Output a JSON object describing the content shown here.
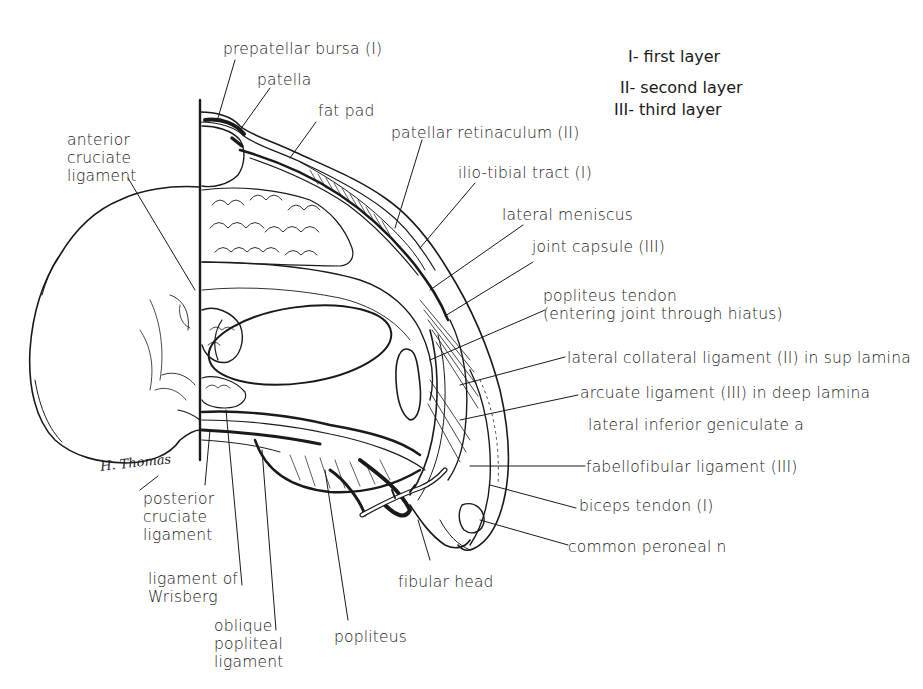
{
  "figure": {
    "signature": "H. Thomas"
  },
  "legend": {
    "items": [
      {
        "key": "I",
        "label": "first layer"
      },
      {
        "key": "II",
        "label": "second layer"
      },
      {
        "key": "III",
        "label": "third layer"
      }
    ],
    "lines": [
      "I- first layer",
      "II- second layer",
      "III- third layer"
    ]
  },
  "labels": {
    "prepatellar_bursa": "prepatellar bursa (I)",
    "patella": "patella",
    "fat_pad": "fat pad",
    "patellar_retinaculum": "patellar retinaculum (II)",
    "ilio_tibial_tract": "ilio-tibial tract (I)",
    "lateral_meniscus": "lateral meniscus",
    "joint_capsule": "joint capsule (III)",
    "popliteus_tendon": "popliteus tendon\n(entering joint through hiatus)",
    "lateral_collateral_ligament": "lateral collateral ligament (II) in sup lamina",
    "arcuate_ligament": "arcuate ligament (III) in deep lamina",
    "lateral_inferior_geniculate": "lateral inferior geniculate a",
    "fabellofibular_ligament": "fabellofibular ligament (III)",
    "biceps_tendon": "biceps tendon (I)",
    "common_peroneal": "common peroneal n",
    "fibular_head": "fibular head",
    "popliteus": "popliteus",
    "oblique_popliteal_ligament": "oblique\npopliteal\nligament",
    "ligament_of_wrisberg": "ligament of\nWrisberg",
    "posterior_cruciate_ligament": "posterior\ncruciate\nligament",
    "anterior_cruciate_ligament": "anterior\ncruciate\nligament"
  },
  "colors": {
    "ink": "#1a1a1a",
    "paper": "#ffffff"
  }
}
